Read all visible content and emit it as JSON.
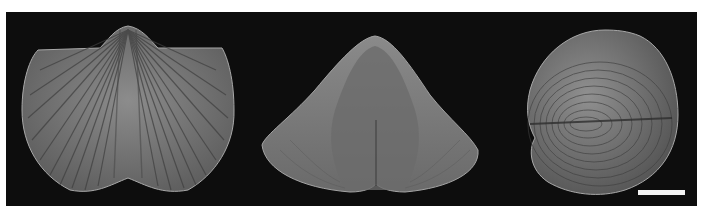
{
  "figure": {
    "background": "#0d0d0d",
    "specimens": [
      {
        "view": "dorsal",
        "shape": "fan-shaped ribbed valve with median sulcus"
      },
      {
        "view": "anterior",
        "shape": "triangular valve with central fold"
      },
      {
        "view": "lateral",
        "shape": "ovoid valve with concentric growth lines"
      }
    ],
    "scale_bar": {
      "color": "#f4f4f4",
      "label": ""
    }
  }
}
